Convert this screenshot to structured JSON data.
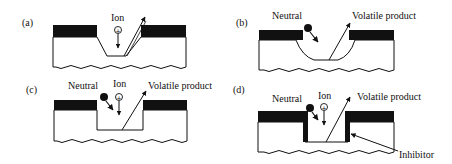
{
  "figure": {
    "panels": [
      {
        "id": "a",
        "label": "(a)",
        "annotations": {
          "ion": "Ion"
        },
        "profile": "tapered-trench"
      },
      {
        "id": "b",
        "label": "(b)",
        "annotations": {
          "neutral": "Neutral",
          "volatile": "Volatile product"
        },
        "profile": "isotropic-undercut"
      },
      {
        "id": "c",
        "label": "(c)",
        "annotations": {
          "neutral": "Neutral",
          "ion": "Ion",
          "volatile": "Volatile product"
        },
        "profile": "anisotropic-trench"
      },
      {
        "id": "d",
        "label": "(d)",
        "annotations": {
          "neutral": "Neutral",
          "ion": "Ion",
          "volatile": "Volatile product",
          "inhibitor": "Inhibitor"
        },
        "profile": "inhibitor-sidewall-trench"
      }
    ],
    "ion_symbol": "+",
    "colors": {
      "ink": "#111111",
      "background": "#ffffff"
    }
  }
}
